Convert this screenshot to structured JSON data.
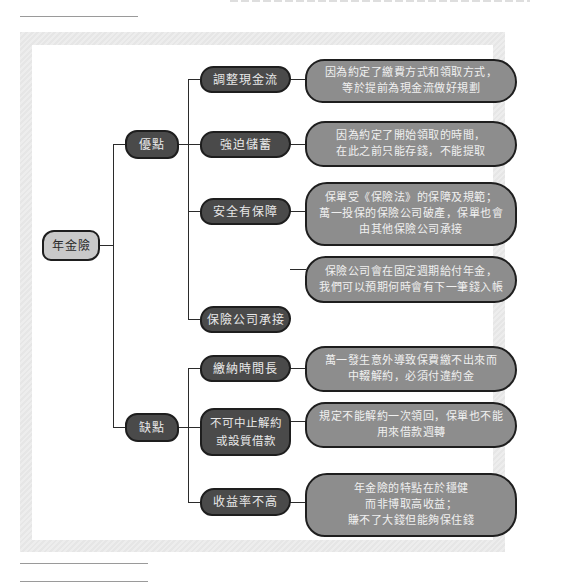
{
  "diagram": {
    "root": {
      "label": "年金險"
    },
    "categories": [
      {
        "label": "優點",
        "items": [
          {
            "label": "調整現金流",
            "description": "因為約定了繳費方式和領取方式，\n等於提前為現金流做好規劃"
          },
          {
            "label": "強迫儲蓄",
            "description": "因為約定了開始領取的時間，\n在此之前只能存錢，不能提取"
          },
          {
            "label": "安全有保障",
            "description": "保單受《保險法》的保障及規範；\n萬一投保的保險公司破產，保單也會\n由其他保險公司承接"
          },
          {
            "label": "保險公司承接",
            "description": "保險公司會在固定週期給付年金，\n我們可以預期何時會有下一筆錢入帳"
          }
        ]
      },
      {
        "label": "缺點",
        "items": [
          {
            "label": "繳納時間長",
            "description": "萬一發生意外導致保費繳不出來而\n中輟解約，必須付違約金"
          },
          {
            "label": "不可中止解約\n或設質借款",
            "description": "規定不能解約一次領回，保單也不能\n用來借款週轉"
          },
          {
            "label": "收益率不高",
            "description": "年金險的特點在於穩健\n而非博取高收益；\n賺不了大錢但能夠保住錢"
          }
        ]
      }
    ]
  },
  "colors": {
    "root_fill": "#c9c9c9",
    "category_fill": "#4a4a4a",
    "description_fill": "#8d8d8d",
    "frame": "#e8e8e8",
    "line": "#2b2b2b"
  }
}
